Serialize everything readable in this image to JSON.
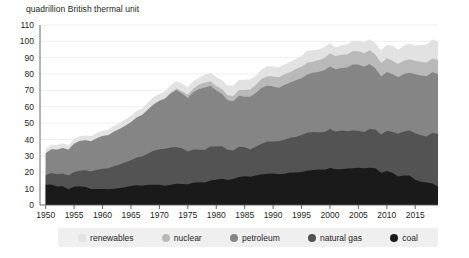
{
  "chart_data": {
    "type": "area",
    "stacked": true,
    "title": "quadrillion British thermal unit",
    "subtitle": "",
    "xlabel": "",
    "ylabel": "quadrillion British thermal unit",
    "xlim": [
      1949,
      2019
    ],
    "ylim": [
      0,
      110
    ],
    "ytick_step": 10,
    "yticks": [
      0,
      10,
      20,
      30,
      40,
      50,
      60,
      70,
      80,
      90,
      100,
      110
    ],
    "xticks": [
      1950,
      1955,
      1960,
      1965,
      1970,
      1975,
      1980,
      1985,
      1990,
      1995,
      2000,
      2005,
      2010,
      2015
    ],
    "grid": "horizontal",
    "legend_position": "bottom",
    "x": [
      1950,
      1951,
      1952,
      1953,
      1954,
      1955,
      1956,
      1957,
      1958,
      1959,
      1960,
      1961,
      1962,
      1963,
      1964,
      1965,
      1966,
      1967,
      1968,
      1969,
      1970,
      1971,
      1972,
      1973,
      1974,
      1975,
      1976,
      1977,
      1978,
      1979,
      1980,
      1981,
      1982,
      1983,
      1984,
      1985,
      1986,
      1987,
      1988,
      1989,
      1990,
      1991,
      1992,
      1993,
      1994,
      1995,
      1996,
      1997,
      1998,
      1999,
      2000,
      2001,
      2002,
      2003,
      2004,
      2005,
      2006,
      2007,
      2008,
      2009,
      2010,
      2011,
      2012,
      2013,
      2014,
      2015,
      2016,
      2017,
      2018,
      2019
    ],
    "series": [
      {
        "name": "coal",
        "color": "#1a1a1a",
        "values": [
          12.3,
          12.6,
          11.3,
          11.4,
          9.7,
          11.2,
          11.4,
          11.0,
          9.8,
          9.8,
          9.8,
          9.6,
          10.0,
          10.4,
          10.9,
          11.6,
          12.1,
          11.8,
          12.3,
          12.4,
          12.3,
          11.8,
          12.4,
          13.0,
          12.9,
          12.7,
          13.6,
          13.9,
          13.8,
          15.0,
          15.4,
          16.0,
          15.3,
          15.9,
          17.1,
          17.5,
          17.3,
          18.0,
          18.8,
          19.1,
          19.2,
          18.8,
          19.1,
          19.8,
          19.9,
          20.1,
          21.0,
          21.4,
          21.7,
          21.6,
          22.6,
          21.9,
          21.9,
          22.3,
          22.5,
          22.8,
          22.4,
          22.7,
          22.4,
          19.7,
          20.8,
          19.7,
          17.4,
          18.0,
          18.0,
          15.5,
          14.2,
          13.8,
          13.2,
          11.3
        ]
      },
      {
        "name": "natural gas",
        "color": "#535353",
        "values": [
          6.0,
          7.0,
          7.5,
          7.9,
          8.3,
          9.0,
          9.6,
          10.2,
          10.7,
          11.7,
          12.4,
          12.9,
          13.7,
          14.4,
          15.3,
          15.8,
          17.0,
          17.9,
          19.2,
          20.7,
          21.8,
          22.5,
          22.7,
          22.5,
          21.7,
          20.0,
          20.3,
          19.9,
          20.0,
          20.7,
          20.4,
          19.9,
          18.5,
          17.4,
          18.5,
          17.8,
          16.6,
          17.7,
          18.6,
          19.7,
          19.6,
          20.1,
          20.8,
          21.3,
          21.7,
          22.7,
          23.1,
          23.2,
          22.8,
          22.9,
          23.8,
          22.9,
          23.6,
          22.9,
          23.0,
          22.6,
          22.2,
          23.7,
          23.8,
          23.4,
          24.6,
          24.9,
          26.1,
          26.9,
          27.5,
          28.3,
          28.5,
          28.0,
          31.0,
          32.1
        ]
      },
      {
        "name": "petroleum",
        "color": "#858585",
        "values": [
          13.3,
          14.4,
          14.9,
          15.6,
          15.8,
          17.3,
          18.1,
          18.3,
          18.5,
          19.3,
          19.9,
          20.2,
          21.0,
          21.7,
          22.3,
          23.2,
          24.4,
          25.3,
          26.9,
          28.3,
          29.5,
          30.6,
          33.0,
          34.8,
          33.5,
          32.7,
          35.2,
          37.1,
          38.0,
          37.1,
          34.2,
          31.9,
          30.2,
          30.1,
          31.1,
          30.9,
          32.2,
          32.9,
          34.2,
          34.2,
          33.6,
          32.8,
          33.5,
          33.8,
          34.7,
          34.6,
          35.7,
          36.2,
          36.8,
          37.8,
          38.3,
          38.2,
          38.2,
          38.8,
          40.3,
          40.4,
          39.9,
          39.8,
          37.2,
          35.4,
          35.9,
          35.3,
          34.5,
          35.1,
          35.3,
          36.1,
          36.5,
          36.9,
          37.0,
          36.7
        ]
      },
      {
        "name": "nuclear",
        "color": "#b9b9b9",
        "values": [
          0.0,
          0.0,
          0.0,
          0.0,
          0.0,
          0.0,
          0.0,
          0.0,
          0.0,
          0.0,
          0.0,
          0.0,
          0.0,
          0.0,
          0.0,
          0.0,
          0.1,
          0.1,
          0.1,
          0.2,
          0.2,
          0.4,
          0.6,
          0.9,
          1.3,
          1.9,
          2.1,
          2.7,
          3.0,
          2.8,
          2.7,
          3.0,
          3.1,
          3.2,
          3.6,
          4.1,
          4.5,
          4.9,
          5.6,
          5.7,
          6.1,
          6.4,
          6.5,
          6.4,
          6.8,
          7.1,
          7.2,
          6.7,
          7.1,
          7.6,
          7.9,
          8.0,
          8.1,
          7.9,
          8.2,
          8.2,
          8.2,
          8.4,
          8.4,
          8.3,
          8.4,
          8.3,
          8.1,
          8.2,
          8.3,
          8.3,
          8.4,
          8.4,
          8.4,
          8.5
        ]
      },
      {
        "name": "renewables",
        "color": "#e2e2e2",
        "values": [
          2.9,
          2.8,
          2.9,
          2.8,
          2.7,
          2.8,
          2.9,
          3.0,
          3.2,
          3.3,
          3.3,
          3.4,
          3.6,
          3.6,
          3.8,
          4.0,
          4.0,
          4.1,
          4.2,
          4.5,
          4.1,
          4.3,
          4.5,
          4.5,
          4.8,
          4.7,
          4.7,
          4.2,
          5.0,
          5.2,
          5.5,
          5.5,
          5.9,
          6.4,
          6.3,
          6.2,
          6.2,
          5.7,
          5.6,
          6.3,
          6.1,
          6.2,
          5.9,
          6.2,
          6.1,
          6.6,
          7.2,
          7.1,
          6.6,
          6.7,
          6.3,
          5.3,
          5.9,
          6.2,
          6.3,
          6.4,
          6.8,
          6.7,
          7.2,
          7.6,
          8.1,
          9.2,
          8.8,
          9.3,
          9.6,
          9.5,
          10.2,
          11.0,
          11.5,
          11.5
        ]
      }
    ],
    "legend_entries": [
      {
        "label": "renewables",
        "color": "#e2e2e2"
      },
      {
        "label": "nuclear",
        "color": "#b9b9b9"
      },
      {
        "label": "petroleum",
        "color": "#858585"
      },
      {
        "label": "natural gas",
        "color": "#535353"
      },
      {
        "label": "coal",
        "color": "#1a1a1a"
      }
    ]
  },
  "plot": {
    "left": 40,
    "right": 438,
    "top": 25,
    "bottom": 205,
    "grid_color": "#e8e8e8",
    "axis_color": "#58595b"
  },
  "legend": {
    "background": "#efefef"
  }
}
